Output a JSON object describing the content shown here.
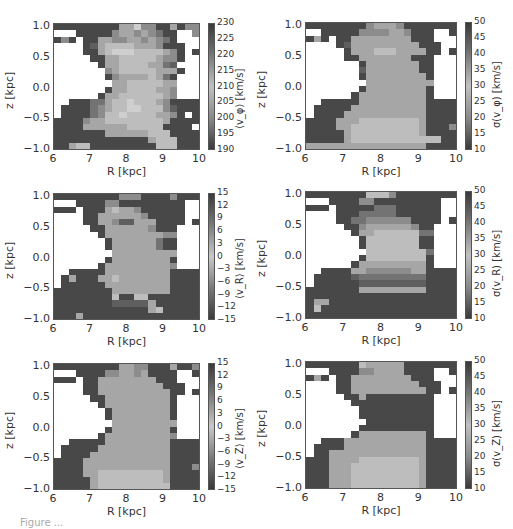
{
  "chart_data": [
    {
      "type": "heatmap",
      "id": "vphi_mean",
      "xlabel": "R [kpc]",
      "ylabel": "z [kpc]",
      "colorbar_label": "⟨v_φ⟩ [km/s]",
      "xlim": [
        6,
        10
      ],
      "ylim": [
        -1.05,
        1.05
      ],
      "xticks": [
        "6",
        "7",
        "8",
        "9",
        "10"
      ],
      "yticks": [
        "1.0",
        "0.5",
        "0.0",
        "−0.5",
        "−1.0"
      ],
      "colorbar_ticks": [
        "230",
        "225",
        "220",
        "215",
        "210",
        "205",
        "200",
        "195",
        "190"
      ],
      "vmin": 190,
      "vmax": 230
    },
    {
      "type": "heatmap",
      "id": "vphi_sigma",
      "xlabel": "R [kpc]",
      "ylabel": "z [kpc]",
      "colorbar_label": "σ(v_φ) [km/s]",
      "xlim": [
        6,
        10
      ],
      "ylim": [
        -1.05,
        1.05
      ],
      "xticks": [
        "6",
        "7",
        "8",
        "9",
        "10"
      ],
      "yticks": [
        "1.0",
        "0.5",
        "0.0",
        "−0.5",
        "−1.0"
      ],
      "colorbar_ticks": [
        "50",
        "45",
        "40",
        "35",
        "30",
        "25",
        "20",
        "15",
        "10"
      ],
      "vmin": 10,
      "vmax": 50
    },
    {
      "type": "heatmap",
      "id": "vR_mean",
      "xlabel": "R [kpc]",
      "ylabel": "z [kpc]",
      "colorbar_label": "⟨v_R⟩ [km/s]",
      "xlim": [
        6,
        10
      ],
      "ylim": [
        -1.05,
        1.05
      ],
      "xticks": [
        "6",
        "7",
        "8",
        "9",
        "10"
      ],
      "yticks": [
        "1.0",
        "0.5",
        "0.0",
        "−0.5",
        "−1.0"
      ],
      "colorbar_ticks": [
        "15",
        "12",
        "9",
        "6",
        "3",
        "0",
        "−3",
        "−6",
        "−9",
        "−12",
        "−15"
      ],
      "vmin": -15,
      "vmax": 15
    },
    {
      "type": "heatmap",
      "id": "vR_sigma",
      "xlabel": "R [kpc]",
      "ylabel": "z [kpc]",
      "colorbar_label": "σ(v_R) [km/s]",
      "xlim": [
        6,
        10
      ],
      "ylim": [
        -1.05,
        1.05
      ],
      "xticks": [
        "6",
        "7",
        "8",
        "9",
        "10"
      ],
      "yticks": [
        "1.0",
        "0.5",
        "0.0",
        "−0.5",
        "−1.0"
      ],
      "colorbar_ticks": [
        "50",
        "45",
        "40",
        "35",
        "30",
        "25",
        "20",
        "15",
        "10"
      ],
      "vmin": 10,
      "vmax": 50
    },
    {
      "type": "heatmap",
      "id": "vZ_mean",
      "xlabel": "R [kpc]",
      "ylabel": "z [kpc]",
      "colorbar_label": "⟨v_Z⟩ [km/s]",
      "xlim": [
        6,
        10
      ],
      "ylim": [
        -1.05,
        1.05
      ],
      "xticks": [
        "6",
        "7",
        "8",
        "9",
        "10"
      ],
      "yticks": [
        "1.0",
        "0.5",
        "0.0",
        "−0.5",
        "−1.0"
      ],
      "colorbar_ticks": [
        "15",
        "12",
        "9",
        "6",
        "3",
        "0",
        "−3",
        "−6",
        "−9",
        "−12",
        "−15"
      ],
      "vmin": -15,
      "vmax": 15
    },
    {
      "type": "heatmap",
      "id": "vZ_sigma",
      "xlabel": "R [kpc]",
      "ylabel": "z [kpc]",
      "colorbar_label": "σ(v_Z) [km/s]",
      "xlim": [
        6,
        10
      ],
      "ylim": [
        -1.05,
        1.05
      ],
      "xticks": [
        "6",
        "7",
        "8",
        "9",
        "10"
      ],
      "yticks": [
        "1.0",
        "0.5",
        "0.0",
        "−0.5",
        "−1.0"
      ],
      "colorbar_ticks": [
        "50",
        "45",
        "40",
        "35",
        "30",
        "25",
        "20",
        "15",
        "10"
      ],
      "vmin": 10,
      "vmax": 50
    }
  ],
  "grids": {
    "vphi_mean": [
      "22222222266855226255",
      "00022222566565422005",
      "25202266556656542000",
      "00002367777666522200",
      "00002267888777765202",
      "00000226677777655200",
      "00000026677776643000",
      "00000005677777666200",
      "00000002566667642000",
      "00000000667777766000",
      "00000002667777665000",
      "00000026677777765000",
      "00222446778777652222",
      "02222456778877753222",
      "02222457787777665202",
      "22225667777777762222",
      "22226666667777722220",
      "22222226666667772222",
      "22222222222226777222",
      "22677222222222777222"
    ],
    "vphi_sigma": [
      "22222222566652222222",
      "00222225555665222002",
      "26202266666666222000",
      "00002366666666622200",
      "00000266677766662202",
      "00000226666666222000",
      "00000002666666622000",
      "00000003666666622000",
      "00000002666666662000",
      "00000000666666666000",
      "00000002666666662000",
      "00000026666666662000",
      "00222226666666662222",
      "02222266666666662222",
      "02222666666666662222",
      "22226667777777762222",
      "22226677777777762225",
      "22222677777777762222",
      "22222677777777777722",
      "66666666666666662222"
    ],
    "vR_mean": [
      "22222222255522225222",
      "00022225522222222200",
      "22202226766522222200",
      "00002266666652222200",
      "00002266533666222202",
      "00000226666665222000",
      "00000026666666655000",
      "00000002666666422000",
      "00000002666666422000",
      "00000000666666666000",
      "00000002666666662000",
      "00000026666666665000",
      "00222226666666662222",
      "02622266766666662222",
      "02222226666666662222",
      "22222222666666662222",
      "22222222722772222222",
      "22222222333336222222",
      "22222222222226722222",
      "22262222222222222222"
    ],
    "vR_sigma": [
      "22222222777522222222",
      "00022225522222222200",
      "22202222244422222200",
      "00002224444422222200",
      "00002244555555222202",
      "00000225666666522000",
      "00000026677777744000",
      "00000002777777722000",
      "00000002777777722000",
      "00000000777777774000",
      "00000002777777772000",
      "00000026666666662000",
      "00222266555555662222",
      "02222234444444442222",
      "02222223333333332222",
      "22222226666666662222",
      "22222222222222222222",
      "26622222222222222222",
      "27222222222222222222",
      "22222222222222222222"
    ],
    "vZ_mean": [
      "22222222266552226225",
      "00022225566562222002",
      "22202266666666222000",
      "00002266666666622200",
      "00002266666666662202",
      "00000226666666662000",
      "00000026666666662000",
      "00000002666666662000",
      "00000002666666662000",
      "00000000666666666000",
      "00000002666666662000",
      "00000026666666665000",
      "00222226666666662222",
      "02222266666666662222",
      "02222666666666662222",
      "22226666666666662222",
      "22226666666666662225",
      "22226677777777762222",
      "22222677777777762222",
      "22222677777777772222"
    ],
    "vZ_sigma": [
      "22222227666662222222",
      "00022225566662222002",
      "26202266666666222000",
      "00002266666666622200",
      "00002266666666662202",
      "00000226222222222000",
      "00000022222222222000",
      "00000002222222222000",
      "00000002222222222000",
      "00000000222222222000",
      "00000002222222222000",
      "00000026666666662000",
      "00222666666666662222",
      "02222666666666662222",
      "02266666666666662222",
      "22266667777777762222",
      "22266677777777762222",
      "22266677777777762222",
      "22266677777777762222",
      "22266677777777762222"
    ]
  },
  "caption": "Figure ..."
}
